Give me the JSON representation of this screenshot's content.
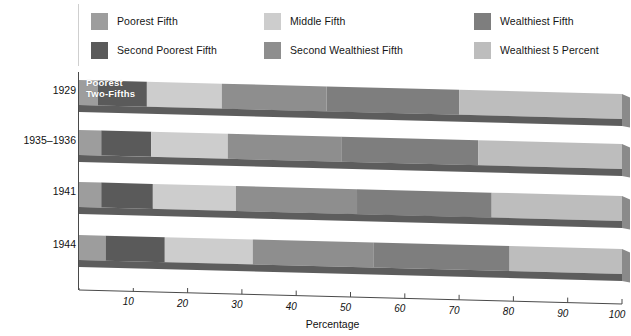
{
  "legend": {
    "columns": [
      {
        "items": [
          {
            "label": "Poorest Fifth",
            "color": "#9d9d9d",
            "key": "poorest_fifth"
          },
          {
            "label": "Second Poorest Fifth",
            "color": "#5a5a5a",
            "key": "second_poorest_fifth"
          }
        ]
      },
      {
        "items": [
          {
            "label": "Middle Fifth",
            "color": "#cdcdcd",
            "key": "middle_fifth"
          },
          {
            "label": "Second Wealthiest Fifth",
            "color": "#8e8e8e",
            "key": "second_wealthiest_fifth"
          }
        ]
      },
      {
        "items": [
          {
            "label": "Wealthiest Fifth",
            "color": "#7e7e7e",
            "key": "wealthiest_fifth"
          },
          {
            "label": "Wealthiest 5 Percent",
            "color": "#bdbdbd",
            "key": "wealthiest_5_percent"
          }
        ]
      }
    ]
  },
  "annotation": {
    "bar_note_line1": "Poorest",
    "bar_note_line2": "Two-Fifths"
  },
  "axis": {
    "x_title": "Percentage",
    "x_ticks": [
      10,
      20,
      30,
      40,
      50,
      60,
      70,
      80,
      90,
      100
    ],
    "x_tick_labels": [
      "10",
      "20",
      "30",
      "40",
      "50",
      "60",
      "70",
      "80",
      "90",
      "100"
    ],
    "x_min": 0,
    "x_max": 100,
    "y_categories": [
      "1929",
      "1935–1936",
      "1941",
      "1944"
    ]
  },
  "chart_data": {
    "type": "bar",
    "orientation": "horizontal",
    "stacked": true,
    "percent_stacked": true,
    "title": "",
    "subtitle": "",
    "xlabel": "Percentage",
    "ylabel": "",
    "xlim": [
      0,
      100
    ],
    "grid": false,
    "legend_position": "top",
    "categories": [
      "1929",
      "1935–1936",
      "1941",
      "1944"
    ],
    "series": [
      {
        "name": "Poorest Fifth",
        "color": "#9d9d9d",
        "values": [
          3.5,
          4.1,
          4.1,
          4.9
        ]
      },
      {
        "name": "Second Poorest Fifth",
        "color": "#5a5a5a",
        "values": [
          9.0,
          9.2,
          9.5,
          10.9
        ]
      },
      {
        "name": "Middle Fifth",
        "color": "#cdcdcd",
        "values": [
          13.8,
          14.1,
          15.3,
          16.2
        ]
      },
      {
        "name": "Second Wealthiest Fifth",
        "color": "#8e8e8e",
        "values": [
          19.3,
          20.9,
          22.3,
          22.2
        ]
      },
      {
        "name": "Wealthiest Fifth",
        "color": "#7e7e7e",
        "values": [
          54.4,
          51.7,
          48.8,
          45.8
        ]
      },
      {
        "name": "Wealthiest 5 Percent",
        "color": "#bdbdbd",
        "values": [
          30.0,
          26.5,
          24.0,
          20.7
        ]
      }
    ],
    "notes": [
      "The Wealthiest 5 Percent band is drawn as the rightmost portion of the Wealthiest Fifth band.",
      "Bars are rendered with a 3D slab / perspective effect; the axis line slants downward to the right."
    ]
  },
  "bar_segments": {
    "1929": {
      "boundaries": [
        0,
        3.5,
        12.5,
        26.3,
        45.6,
        70.0,
        100
      ]
    },
    "1935–1936": {
      "boundaries": [
        0,
        4.1,
        13.3,
        27.4,
        48.3,
        73.5,
        100
      ]
    },
    "1941": {
      "boundaries": [
        0,
        4.1,
        13.6,
        28.9,
        51.2,
        76.0,
        100
      ]
    },
    "1944": {
      "boundaries": [
        0,
        4.9,
        15.8,
        32.0,
        54.2,
        79.3,
        100
      ]
    }
  },
  "colors": {
    "axis": "#4a4a4a",
    "shadow_dark": "#5d5d5d",
    "legend_divider": "#cfcfcf",
    "text": "#111111"
  }
}
